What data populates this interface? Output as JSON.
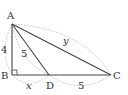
{
  "diagram": {
    "type": "geometry-right-triangle",
    "vertices": {
      "A": {
        "label": "A",
        "x": 12,
        "y": 24
      },
      "B": {
        "label": "B",
        "x": 12,
        "y": 75
      },
      "D": {
        "label": "D",
        "x": 49,
        "y": 75
      },
      "C": {
        "label": "C",
        "x": 111,
        "y": 75
      }
    },
    "measures": {
      "AB": "4",
      "AD": "5",
      "AC": "y",
      "BD": "x",
      "DC": "5"
    },
    "right_angle_at": "B",
    "colors": {
      "line": "#444444",
      "dashed": "#aaaaaa",
      "text": "#333333"
    }
  }
}
